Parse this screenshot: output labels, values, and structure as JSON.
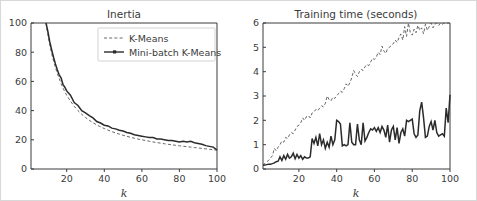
{
  "figure": {
    "border_color": "#d8d8d8",
    "background": "#ffffff"
  },
  "legend": {
    "position": "upper-right-of-left-subplot",
    "entries": [
      {
        "label": "K-Means",
        "style": "dashed",
        "color": "#555555"
      },
      {
        "label": "Mini-batch K-Means",
        "style": "solid-with-marker",
        "color": "#2b2b2b"
      }
    ]
  },
  "chart_data": [
    {
      "type": "line",
      "title": "Inertia",
      "xlabel": "k",
      "ylabel": "",
      "xlim": [
        1,
        100
      ],
      "ylim": [
        0,
        100
      ],
      "xticks": [
        20,
        40,
        60,
        80,
        100
      ],
      "yticks": [
        0,
        20,
        40,
        60,
        80,
        100
      ],
      "grid": false,
      "legend": [
        "K-Means",
        "Mini-batch K-Means"
      ],
      "x": [
        9,
        10,
        11,
        12,
        13,
        14,
        15,
        16,
        17,
        18,
        19,
        20,
        22,
        24,
        26,
        28,
        30,
        32,
        34,
        36,
        38,
        40,
        42,
        44,
        46,
        48,
        50,
        52,
        54,
        56,
        58,
        60,
        62,
        64,
        66,
        68,
        70,
        72,
        74,
        76,
        78,
        80,
        82,
        84,
        86,
        88,
        90,
        92,
        94,
        96,
        98,
        100
      ],
      "series": [
        {
          "name": "K-Means",
          "values": [
            100,
            92,
            85,
            79,
            74,
            69.5,
            65.5,
            62,
            58.5,
            55.5,
            53,
            50.5,
            46.5,
            43,
            40,
            37.5,
            35.3,
            33.4,
            31.7,
            30.2,
            28.9,
            27.7,
            26.6,
            25.6,
            24.7,
            23.9,
            23.1,
            22.4,
            21.7,
            21.1,
            20.5,
            20,
            19.5,
            19,
            18.5,
            18.1,
            17.7,
            17.3,
            16.9,
            16.6,
            16.2,
            15.9,
            15.6,
            15.3,
            15,
            14.7,
            14.4,
            14.1,
            13.8,
            13.5,
            13.2,
            12.9
          ]
        },
        {
          "name": "Mini-batch K-Means",
          "values": [
            100,
            94,
            87,
            81.5,
            76.5,
            72,
            68,
            64.5,
            62.5,
            58,
            56,
            53.5,
            50.5,
            45.5,
            43.5,
            40,
            38.5,
            36.5,
            35,
            32.5,
            31.5,
            30,
            29.5,
            28,
            27.5,
            26.5,
            26,
            25,
            24.5,
            23.5,
            23,
            22.5,
            22,
            21.5,
            21.5,
            20.5,
            20.5,
            20,
            19.5,
            19.5,
            19,
            18.5,
            19,
            18.5,
            19,
            18,
            17.5,
            17,
            16,
            15.5,
            15,
            13
          ]
        }
      ]
    },
    {
      "type": "line",
      "title": "Training time (seconds)",
      "xlabel": "k",
      "ylabel": "",
      "xlim": [
        1,
        100
      ],
      "ylim": [
        0,
        6
      ],
      "xticks": [
        20,
        40,
        60,
        80,
        100
      ],
      "yticks": [
        0,
        1,
        2,
        3,
        4,
        5,
        6
      ],
      "grid": false,
      "legend": [
        "K-Means",
        "Mini-batch K-Means"
      ],
      "x": [
        1,
        2,
        3,
        4,
        5,
        6,
        7,
        8,
        9,
        10,
        11,
        12,
        13,
        14,
        15,
        16,
        17,
        18,
        19,
        20,
        21,
        22,
        23,
        24,
        25,
        26,
        27,
        28,
        29,
        30,
        31,
        32,
        33,
        34,
        35,
        36,
        37,
        38,
        39,
        40,
        41,
        42,
        43,
        44,
        45,
        46,
        47,
        48,
        49,
        50,
        51,
        52,
        53,
        54,
        55,
        56,
        57,
        58,
        59,
        60,
        61,
        62,
        63,
        64,
        65,
        66,
        67,
        68,
        69,
        70,
        71,
        72,
        73,
        74,
        75,
        76,
        77,
        78,
        79,
        80,
        81,
        82,
        83,
        84,
        85,
        86,
        87,
        88,
        89,
        90,
        91,
        92,
        93,
        94,
        95,
        96,
        97,
        98,
        99,
        100
      ],
      "series": [
        {
          "name": "K-Means",
          "values": [
            0.18,
            0.22,
            0.3,
            0.35,
            0.45,
            0.55,
            0.85,
            0.75,
            0.9,
            1.0,
            1.15,
            1.1,
            1.3,
            1.25,
            1.4,
            1.5,
            1.45,
            1.6,
            1.75,
            1.8,
            1.9,
            2.1,
            2.0,
            2.15,
            2.2,
            2.1,
            2.3,
            2.35,
            2.45,
            2.4,
            2.5,
            2.6,
            2.55,
            2.7,
            3.0,
            2.85,
            2.8,
            2.95,
            2.9,
            3.0,
            3.1,
            3.2,
            3.15,
            3.3,
            3.5,
            3.4,
            3.55,
            3.75,
            4.05,
            3.9,
            3.8,
            4.0,
            4.1,
            4.05,
            4.2,
            4.3,
            4.25,
            4.4,
            4.55,
            4.5,
            4.6,
            4.8,
            4.7,
            5.05,
            4.85,
            4.75,
            4.95,
            5.0,
            5.1,
            5.15,
            5.3,
            5.2,
            5.4,
            5.55,
            5.3,
            5.85,
            5.45,
            6.0,
            5.6,
            5.5,
            5.75,
            5.6,
            5.9,
            5.7,
            5.8,
            5.55,
            5.95,
            5.7,
            5.85,
            6.0,
            5.8,
            5.95,
            6.0,
            5.9,
            6.0,
            5.95,
            6.0,
            6.0,
            6.0,
            6.0
          ]
        },
        {
          "name": "Mini-batch K-Means",
          "values": [
            0.15,
            0.16,
            0.18,
            0.2,
            0.2,
            0.22,
            0.25,
            0.3,
            0.32,
            0.5,
            0.35,
            0.55,
            0.4,
            0.6,
            0.45,
            0.5,
            0.65,
            0.42,
            0.6,
            0.45,
            0.55,
            0.4,
            0.5,
            0.45,
            0.45,
            0.5,
            1.25,
            1.05,
            1.3,
            0.95,
            1.45,
            1.0,
            1.2,
            0.85,
            1.1,
            0.9,
            1.35,
            1.0,
            1.2,
            2.0,
            1.95,
            1.85,
            0.95,
            1.0,
            0.95,
            1.0,
            1.9,
            1.1,
            1.0,
            1.0,
            1.85,
            1.2,
            1.0,
            1.9,
            1.15,
            1.3,
            1.5,
            1.65,
            1.6,
            1.7,
            1.55,
            1.7,
            1.5,
            1.75,
            1.6,
            1.3,
            1.8,
            1.1,
            1.6,
            1.75,
            1.2,
            1.7,
            1.05,
            1.5,
            1.65,
            1.35,
            2.0,
            1.95,
            2.0,
            2.05,
            1.45,
            1.3,
            1.4,
            2.4,
            2.75,
            2.1,
            1.3,
            1.35,
            1.75,
            1.95,
            1.6,
            2.0,
            1.5,
            1.35,
            1.4,
            1.45,
            1.35,
            2.5,
            1.9,
            3.05
          ]
        }
      ]
    }
  ]
}
